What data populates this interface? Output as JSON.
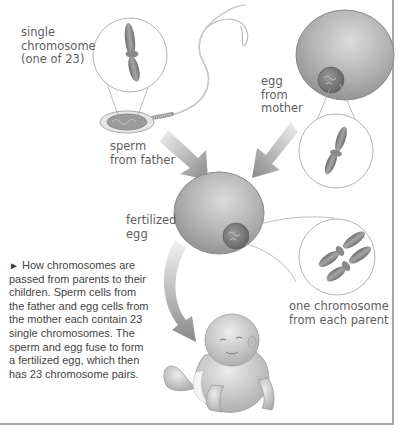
{
  "labels": {
    "single_chromosome": "single\nchromosome\n(one of 23)",
    "sperm": "sperm\nfrom father",
    "egg": "egg\nfrom\nmother",
    "fertilized_egg": "fertilized\negg",
    "one_from_each": "one chromosome\nfrom each parent"
  },
  "caption": {
    "marker": "►",
    "text": "How chromosomes are passed from parents to their children. Sperm cells from the father and egg cells from the mother each contain 23 single chromosomes. The sperm and egg fuse to form a fertilized egg, which then has 23 chromosome pairs."
  },
  "colors": {
    "cell_fill": "#a9a9a9",
    "cell_highlight": "#d8d8d8",
    "arrow": "#8c8c8c",
    "border": "#a8a8a8"
  }
}
